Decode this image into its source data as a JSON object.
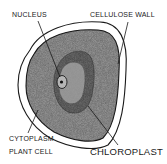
{
  "diagram": {
    "title": "PLANT CELL",
    "labels": {
      "nucleus": "NUCLEUS",
      "cellulose_wall": "CELLULOSE WALL",
      "cytoplasm": "CYTOPLASM",
      "chloroplast": "CHLOROPLAST",
      "plant_cell": "PLANT CELL"
    },
    "colors": {
      "background": "#ffffff",
      "ink": "#1a1a1a",
      "cytoplasm_fill": "#9a9a9a",
      "chloroplast_fill": "#6e6e6e",
      "nucleus_fill": "#b5b5b5"
    }
  }
}
